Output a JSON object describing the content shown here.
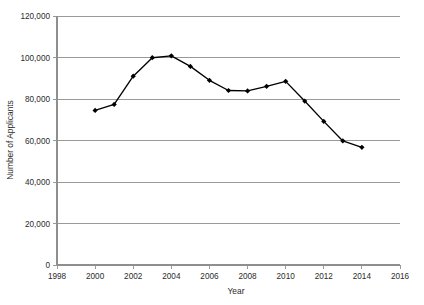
{
  "chart_data": {
    "type": "line",
    "title": "",
    "xlabel": "Year",
    "ylabel": "Number of Applicants",
    "xlim": [
      1998,
      2016
    ],
    "ylim": [
      0,
      120000
    ],
    "grid": true,
    "legend": "none",
    "x": [
      2000,
      2001,
      2002,
      2003,
      2004,
      2005,
      2006,
      2007,
      2008,
      2009,
      2010,
      2011,
      2012,
      2013,
      2014
    ],
    "values": [
      74500,
      77400,
      91000,
      99900,
      100800,
      95700,
      89000,
      84100,
      83900,
      86100,
      88500,
      79000,
      69200,
      59800,
      56700
    ],
    "series": [
      {
        "name": "Number of Applicants",
        "values": [
          74500,
          77400,
          91000,
          99900,
          100800,
          95700,
          89000,
          84100,
          83900,
          86100,
          88500,
          79000,
          69200,
          59800,
          56700
        ]
      }
    ],
    "x_tick_labels": [
      "1998",
      "2000",
      "2002",
      "2004",
      "2006",
      "2008",
      "2010",
      "2012",
      "2014",
      "2016"
    ],
    "x_tick_values": [
      1998,
      2000,
      2002,
      2004,
      2006,
      2008,
      2010,
      2012,
      2014,
      2016
    ],
    "y_tick_labels": [
      "0",
      "20,000",
      "40,000",
      "60,000",
      "80,000",
      "100,000",
      "120,000"
    ],
    "y_tick_values": [
      0,
      20000,
      40000,
      60000,
      80000,
      100000,
      120000
    ],
    "marker": "diamond",
    "line_color": "#000000",
    "marker_color": "#000000",
    "grid_color": "#8f8f8f",
    "background_color": "#ffffff"
  }
}
